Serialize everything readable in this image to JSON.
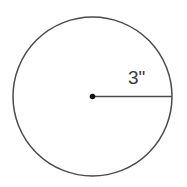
{
  "figure": {
    "name": "circle-with-radius",
    "background_color": "#ffffff",
    "stroke_color": "#4a4a4a",
    "center_dot_color": "#111111",
    "label_color": "#3a3a3a"
  },
  "labels": {
    "radius": "3\""
  },
  "chart_data": {
    "type": "diagram",
    "title": "",
    "shape": "circle",
    "elements": [
      {
        "kind": "circle",
        "center_x": 92.5,
        "center_y": 96.5,
        "radius": 79.5,
        "fill": "none",
        "stroke": "#4a4a4a",
        "stroke_width": 1.5
      },
      {
        "kind": "point",
        "role": "center",
        "x": 92.5,
        "y": 96.5,
        "radius": 2.8,
        "fill": "#111111"
      },
      {
        "kind": "segment",
        "role": "radius",
        "x1": 92.5,
        "y1": 96.5,
        "x2": 172.0,
        "y2": 96.5,
        "stroke": "#4a4a4a",
        "stroke_width": 1.5
      },
      {
        "kind": "text",
        "role": "radius-label",
        "x": 128,
        "y": 84,
        "value": "3\""
      }
    ],
    "measurements": [
      {
        "name": "radius",
        "value": 3,
        "unit": "inches",
        "display": "3\""
      }
    ]
  }
}
